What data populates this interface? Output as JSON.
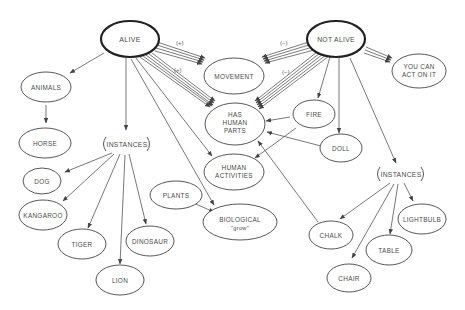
{
  "diagram": {
    "type": "concept-map",
    "nodes": {
      "alive": {
        "label": "ALIVE",
        "emphasis": true
      },
      "not_alive": {
        "label": "NOT ALIVE",
        "emphasis": true
      },
      "animals": {
        "label": "ANIMALS"
      },
      "horse": {
        "label": "HORSE"
      },
      "instances_left": {
        "label": "INSTANCES"
      },
      "dog": {
        "label": "DOG"
      },
      "kangaroo": {
        "label": "KANGAROO"
      },
      "tiger": {
        "label": "TIGER"
      },
      "lion": {
        "label": "LION"
      },
      "dinosaur": {
        "label": "DINOSAUR"
      },
      "plants": {
        "label": "PLANTS"
      },
      "biological": {
        "line1": "BIOLOGICAL",
        "line2": "\"grow\""
      },
      "movement": {
        "label": "MOVEMENT"
      },
      "has_human_parts": {
        "line1": "HAS",
        "line2": "HUMAN",
        "line3": "PARTS"
      },
      "human_activities": {
        "line1": "HUMAN",
        "line2": "ACTIVITIES"
      },
      "fire": {
        "label": "FIRE"
      },
      "doll": {
        "label": "DOLL"
      },
      "you_can_act": {
        "line1": "YOU CAN",
        "line2": "ACT ON IT"
      },
      "instances_right": {
        "label": "INSTANCES"
      },
      "chalk": {
        "label": "CHALK"
      },
      "chair": {
        "label": "CHAIR"
      },
      "table": {
        "label": "TABLE"
      },
      "lightbulb": {
        "label": "LIGHTBULB"
      }
    },
    "edge_labels": {
      "alive_movement": "(+)",
      "alive_parts": "(+)",
      "notalive_movement": "(−)",
      "notalive_parts": "(−)"
    },
    "edges": [
      {
        "from": "ALIVE",
        "to": "ANIMALS"
      },
      {
        "from": "ANIMALS",
        "to": "HORSE"
      },
      {
        "from": "ALIVE",
        "to": "INSTANCES"
      },
      {
        "from": "ALIVE",
        "to": "MOVEMENT",
        "label": "(+)",
        "multi": true
      },
      {
        "from": "ALIVE",
        "to": "HAS HUMAN PARTS",
        "label": "(+)",
        "multi": true
      },
      {
        "from": "ALIVE",
        "to": "HUMAN ACTIVITIES"
      },
      {
        "from": "ALIVE",
        "to": "BIOLOGICAL \"grow\""
      },
      {
        "from": "INSTANCES",
        "to": "DOG"
      },
      {
        "from": "INSTANCES",
        "to": "KANGAROO"
      },
      {
        "from": "INSTANCES",
        "to": "TIGER"
      },
      {
        "from": "INSTANCES",
        "to": "LION"
      },
      {
        "from": "INSTANCES",
        "to": "DINOSAUR"
      },
      {
        "from": "PLANTS",
        "to": "BIOLOGICAL \"grow\""
      },
      {
        "from": "NOT ALIVE",
        "to": "MOVEMENT",
        "label": "(−)",
        "multi": true
      },
      {
        "from": "NOT ALIVE",
        "to": "HAS HUMAN PARTS",
        "label": "(−)",
        "multi": true
      },
      {
        "from": "NOT ALIVE",
        "to": "YOU CAN ACT ON IT",
        "multi": true
      },
      {
        "from": "NOT ALIVE",
        "to": "FIRE"
      },
      {
        "from": "NOT ALIVE",
        "to": "DOLL"
      },
      {
        "from": "NOT ALIVE",
        "to": "INSTANCES (right)"
      },
      {
        "from": "FIRE",
        "to": "HAS HUMAN PARTS"
      },
      {
        "from": "FIRE",
        "to": "HUMAN ACTIVITIES"
      },
      {
        "from": "DOLL",
        "to": "HAS HUMAN PARTS"
      },
      {
        "from": "CHALK",
        "to": "HAS HUMAN PARTS"
      },
      {
        "from": "INSTANCES (right)",
        "to": "CHALK"
      },
      {
        "from": "INSTANCES (right)",
        "to": "CHAIR"
      },
      {
        "from": "INSTANCES (right)",
        "to": "TABLE"
      },
      {
        "from": "INSTANCES (right)",
        "to": "LIGHTBULB"
      }
    ]
  }
}
